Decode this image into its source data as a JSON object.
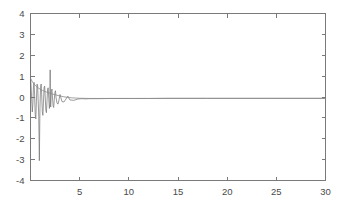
{
  "chart_data": {
    "type": "line",
    "title": "",
    "subtitle": "",
    "xlabel": "",
    "ylabel": "",
    "xlim": [
      0,
      30
    ],
    "ylim": [
      -4,
      4
    ],
    "grid": false,
    "legend": null,
    "box": true,
    "xticks": [
      5,
      10,
      15,
      20,
      25,
      30
    ],
    "xticklabels": [
      "5",
      "10",
      "15",
      "20",
      "25",
      "30"
    ],
    "yticks": [
      -4,
      -3,
      -2,
      -1,
      0,
      1,
      2,
      3,
      4
    ],
    "yticklabels": [
      "-4",
      "-3",
      "-2",
      "-1",
      "0",
      "1",
      "2",
      "3",
      "4"
    ],
    "series": [
      {
        "name": "oscillatory-response",
        "color": "#6e6e6e",
        "x": [
          0.0,
          0.06,
          0.12,
          0.18,
          0.24,
          0.3,
          0.36,
          0.42,
          0.48,
          0.54,
          0.6,
          0.66,
          0.72,
          0.78,
          0.84,
          0.9,
          0.96,
          1.02,
          1.08,
          1.14,
          1.2,
          1.26,
          1.32,
          1.38,
          1.44,
          1.5,
          1.56,
          1.62,
          1.68,
          1.74,
          1.8,
          1.86,
          1.92,
          1.98,
          2.0,
          2.02,
          2.06,
          2.12,
          2.18,
          2.24,
          2.3,
          2.36,
          2.42,
          2.48,
          2.54,
          2.6,
          2.7,
          2.8,
          2.9,
          3.0,
          3.2,
          3.4,
          3.6,
          3.8,
          4.0,
          4.4,
          4.8,
          5.2,
          5.6,
          6.0,
          7.0,
          8.0,
          9.0,
          10.0,
          12.0,
          14.0,
          16.0,
          18.0,
          20.0,
          22.0,
          24.0,
          26.0,
          28.0,
          30.0
        ],
        "y": [
          0.92,
          0.55,
          -0.1,
          -0.72,
          -0.35,
          0.48,
          0.7,
          0.05,
          -0.85,
          -1.05,
          -0.2,
          0.62,
          0.58,
          -0.15,
          -0.92,
          -3.05,
          -0.55,
          0.4,
          0.62,
          0.1,
          -0.7,
          -0.88,
          -0.25,
          0.45,
          0.52,
          -0.05,
          -0.62,
          -0.75,
          -0.18,
          0.38,
          0.44,
          -0.08,
          -0.55,
          -0.3,
          1.3,
          -0.35,
          -0.48,
          0.25,
          0.38,
          -0.05,
          -0.42,
          -0.5,
          -0.12,
          0.22,
          0.3,
          -0.04,
          -0.3,
          -0.34,
          -0.14,
          0.12,
          -0.22,
          -0.24,
          -0.1,
          0.04,
          -0.14,
          -0.16,
          -0.1,
          -0.08,
          -0.09,
          -0.08,
          -0.08,
          -0.07,
          -0.07,
          -0.07,
          -0.07,
          -0.06,
          -0.06,
          -0.06,
          -0.06,
          -0.06,
          -0.06,
          -0.06,
          -0.06,
          -0.06
        ]
      },
      {
        "name": "decay-envelope",
        "color": "#8a8a8a",
        "x": [
          0.0,
          0.2,
          0.4,
          0.6,
          0.8,
          1.0,
          1.2,
          1.4,
          1.6,
          1.8,
          2.0,
          2.2,
          2.4,
          2.6,
          2.8,
          3.0,
          3.4,
          3.8,
          4.2,
          4.6,
          5.0,
          6.0,
          7.0,
          8.0,
          10.0,
          12.0,
          15.0,
          18.0,
          21.0,
          24.0,
          27.0,
          30.0
        ],
        "y": [
          0.9,
          0.72,
          0.6,
          0.5,
          0.43,
          0.37,
          0.32,
          0.28,
          0.24,
          0.21,
          0.18,
          0.15,
          0.12,
          0.1,
          0.07,
          0.05,
          0.01,
          -0.02,
          -0.04,
          -0.05,
          -0.06,
          -0.07,
          -0.07,
          -0.07,
          -0.07,
          -0.07,
          -0.07,
          -0.07,
          -0.07,
          -0.07,
          -0.07,
          -0.07
        ]
      }
    ],
    "annotations": [
      {
        "name": "downward-spike",
        "x": 0.9,
        "y": -3.05
      },
      {
        "name": "upward-spike",
        "x": 2.0,
        "y": 1.3
      }
    ],
    "colors": {
      "background": "#ffffff",
      "axis": "#7a7a7a",
      "tick_text": "#4a4a4a",
      "series_primary": "#6e6e6e",
      "series_secondary": "#8a8a8a"
    }
  }
}
